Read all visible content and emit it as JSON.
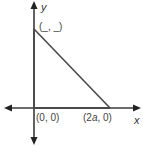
{
  "diagram": {
    "type": "coordinate-plane-right-triangle",
    "axes": {
      "x_label": "x",
      "y_label": "y"
    },
    "vertices": [
      {
        "name": "origin",
        "label": "(0, 0)",
        "coords": [
          0,
          0
        ]
      },
      {
        "name": "x-intercept",
        "label_prefix": "(2",
        "label_var": "a",
        "label_suffix": ", 0)"
      },
      {
        "name": "y-intercept",
        "label": "(_, _)"
      }
    ],
    "colors": {
      "stroke": "#4a4a4a",
      "text": "#444444"
    }
  }
}
